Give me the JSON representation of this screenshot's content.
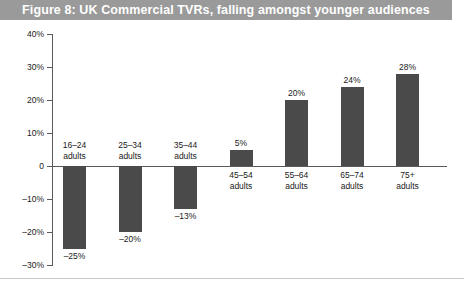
{
  "figure": {
    "title": "Figure 8: UK Commercial TVRs, falling amongst younger audiences",
    "title_bar_color": "#9a9a9a",
    "title_text_color": "#ffffff",
    "bar_color": "#4a4a4a",
    "axis_color": "#5a5a5a"
  },
  "chart_data": {
    "type": "bar",
    "title": "Figure 8: UK Commercial TVRs, falling amongst younger audiences",
    "xlabel": "",
    "ylabel": "",
    "categories": [
      "16–24 adults",
      "25–34 adults",
      "35–44 adults",
      "45–54 adults",
      "55–64 adults",
      "65–74 adults",
      "75+ adults"
    ],
    "category_lines": [
      [
        "16–24",
        "adults"
      ],
      [
        "25–34",
        "adults"
      ],
      [
        "35–44",
        "adults"
      ],
      [
        "45–54",
        "adults"
      ],
      [
        "55–64",
        "adults"
      ],
      [
        "65–74",
        "adults"
      ],
      [
        "75+",
        "adults"
      ]
    ],
    "values": [
      -25,
      -20,
      -13,
      5,
      20,
      24,
      28
    ],
    "value_labels": [
      "–25%",
      "–20%",
      "–13%",
      "5%",
      "20%",
      "24%",
      "28%"
    ],
    "ylim": [
      -30,
      40
    ],
    "yticks": [
      40,
      30,
      20,
      10,
      0,
      -10,
      -20,
      -30
    ],
    "ytick_labels": [
      "40%",
      "30%",
      "20%",
      "10%",
      "0",
      "–10%",
      "–20%",
      "–30%"
    ],
    "grid": false,
    "legend": null
  }
}
